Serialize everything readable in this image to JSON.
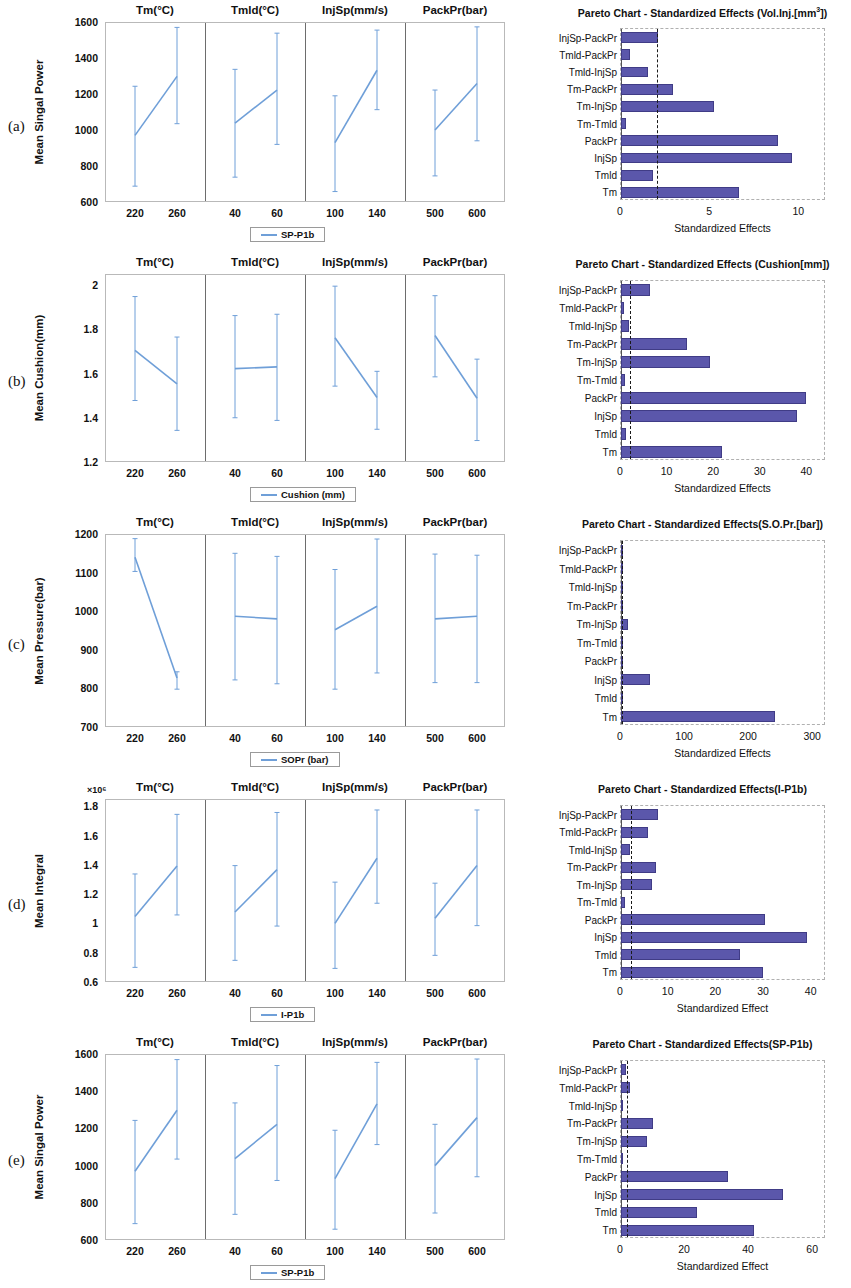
{
  "figure": {
    "panel_letters": [
      "(a)",
      "(b)",
      "(c)",
      "(d)",
      "(e)"
    ],
    "factor_titles": [
      "Tm(°C)",
      "Tmld(°C)",
      "InjSp(mm/s)",
      "PackPr(bar)"
    ],
    "factor_levels": [
      [
        "220",
        "260"
      ],
      [
        "40",
        "60"
      ],
      [
        "100",
        "140"
      ],
      [
        "500",
        "600"
      ]
    ],
    "colors": {
      "line": "#6f9fd8",
      "bar": "#5b57ab",
      "bar_edge": "#403c86",
      "threshold": "#1a1a1a"
    }
  },
  "panels": [
    {
      "letter": "(a)",
      "main_effects": {
        "ylabel": "Mean Singal Power",
        "yticks": [
          "1600",
          "1400",
          "1200",
          "1000",
          "800",
          "600"
        ],
        "legend": "SP-P1b",
        "exponent": ""
      },
      "pareto": {
        "title": "Pareto Chart - Standardized Effects (Vol.Inj.[mm³])",
        "xlabel": "Standardized Effects",
        "xticks": [
          "0",
          "5",
          "10"
        ]
      }
    },
    {
      "letter": "(b)",
      "main_effects": {
        "ylabel": "Mean Cushion(mm)",
        "yticks": [
          "2",
          "1.8",
          "1.6",
          "1.4",
          "1.2"
        ],
        "legend": "Cushion (mm)",
        "exponent": ""
      },
      "pareto": {
        "title": "Pareto Chart - Standardized Effects (Cushion[mm])",
        "xlabel": "Standardized Effects",
        "xticks": [
          "0",
          "10",
          "20",
          "30",
          "40"
        ]
      }
    },
    {
      "letter": "(c)",
      "main_effects": {
        "ylabel": "Mean Pressure(bar)",
        "yticks": [
          "1200",
          "1100",
          "1000",
          "900",
          "800",
          "700"
        ],
        "legend": "SOPr (bar)",
        "exponent": ""
      },
      "pareto": {
        "title": "Pareto Chart - Standardized Effects(S.O.Pr.[bar])",
        "xlabel": "Standardized Effects",
        "xticks": [
          "0",
          "100",
          "200",
          "300"
        ]
      }
    },
    {
      "letter": "(d)",
      "main_effects": {
        "ylabel": "Mean Integral",
        "yticks": [
          "1.8",
          "1.6",
          "1.4",
          "1.2",
          "1",
          "0.8",
          "0.6"
        ],
        "legend": "I-P1b",
        "exponent": "×10⁶"
      },
      "pareto": {
        "title": "Pareto Chart - Standardized Effects(I-P1b)",
        "xlabel": "Standardized Effect",
        "xticks": [
          "0",
          "10",
          "20",
          "30",
          "40"
        ]
      }
    },
    {
      "letter": "(e)",
      "main_effects": {
        "ylabel": "Mean Singal Power",
        "yticks": [
          "1600",
          "1400",
          "1200",
          "1000",
          "800",
          "600"
        ],
        "legend": "SP-P1b",
        "exponent": ""
      },
      "pareto": {
        "title": "Pareto Chart - Standardized Effects(SP-P1b)",
        "xlabel": "Standardized Effect",
        "xticks": [
          "0",
          "20",
          "40",
          "60"
        ]
      }
    }
  ],
  "chart_data": [
    {
      "type": "line",
      "panel": "(a)",
      "title": "Main Effects Plot — Mean Singal Power",
      "ylabel": "Mean Singal Power",
      "ylim": [
        600,
        1600
      ],
      "legend": "SP-P1b",
      "groups": [
        {
          "name": "Tm(°C)",
          "xlabel": "Tm(°C)",
          "categories": [
            "220",
            "260"
          ],
          "values": [
            970,
            1298
          ],
          "err_low": [
            688,
            1035
          ],
          "err_high": [
            1243,
            1570
          ]
        },
        {
          "name": "Tmld(°C)",
          "xlabel": "Tmld(°C)",
          "categories": [
            "40",
            "60"
          ],
          "values": [
            1038,
            1222
          ],
          "err_low": [
            738,
            920
          ],
          "err_high": [
            1337,
            1538
          ]
        },
        {
          "name": "InjSp(mm/s)",
          "xlabel": "InjSp(mm/s)",
          "categories": [
            "100",
            "140"
          ],
          "values": [
            930,
            1332
          ],
          "err_low": [
            658,
            1113
          ],
          "err_high": [
            1190,
            1555
          ]
        },
        {
          "name": "PackPr(bar)",
          "xlabel": "PackPr(bar)",
          "categories": [
            "500",
            "600"
          ],
          "values": [
            1000,
            1258
          ],
          "err_low": [
            745,
            940
          ],
          "err_high": [
            1222,
            1573
          ]
        }
      ]
    },
    {
      "type": "bar",
      "panel": "(a)",
      "orientation": "horizontal",
      "title": "Pareto Chart - Standardized Effects (Vol.Inj.[mm³])",
      "xlabel": "Standardized Effects",
      "xlim": [
        0,
        11.5
      ],
      "xticks": [
        0,
        5,
        10
      ],
      "threshold": 2.0,
      "categories": [
        "InjSp-PackPr",
        "Tmld-PackPr",
        "Tmld-InjSp",
        "Tm-PackPr",
        "Tm-InjSp",
        "Tm-Tmld",
        "PackPr",
        "InjSp",
        "Tmld",
        "Tm"
      ],
      "values": [
        2.1,
        0.5,
        1.5,
        2.9,
        5.2,
        0.3,
        8.8,
        9.6,
        1.8,
        6.6
      ]
    },
    {
      "type": "line",
      "panel": "(b)",
      "title": "Main Effects Plot — Mean Cushion(mm)",
      "ylabel": "Mean Cushion(mm)",
      "ylim": [
        1.2,
        2.05
      ],
      "legend": "Cushion (mm)",
      "groups": [
        {
          "name": "Tm(°C)",
          "xlabel": "Tm(°C)",
          "categories": [
            "220",
            "260"
          ],
          "values": [
            1.705,
            1.553
          ],
          "err_low": [
            1.478,
            1.343
          ],
          "err_high": [
            1.948,
            1.765
          ]
        },
        {
          "name": "Tmld(°C)",
          "xlabel": "Tmld(°C)",
          "categories": [
            "40",
            "60"
          ],
          "values": [
            1.622,
            1.63
          ],
          "err_low": [
            1.4,
            1.388
          ],
          "err_high": [
            1.862,
            1.868
          ]
        },
        {
          "name": "InjSp(mm/s)",
          "xlabel": "InjSp(mm/s)",
          "categories": [
            "100",
            "140"
          ],
          "values": [
            1.762,
            1.492
          ],
          "err_low": [
            1.543,
            1.348
          ],
          "err_high": [
            1.995,
            1.61
          ]
        },
        {
          "name": "PackPr(bar)",
          "xlabel": "PackPr(bar)",
          "categories": [
            "500",
            "600"
          ],
          "values": [
            1.772,
            1.488
          ],
          "err_low": [
            1.585,
            1.297
          ],
          "err_high": [
            1.952,
            1.665
          ]
        }
      ]
    },
    {
      "type": "bar",
      "panel": "(b)",
      "orientation": "horizontal",
      "title": "Pareto Chart - Standardized Effects (Cushion[mm])",
      "xlabel": "Standardized Effects",
      "xlim": [
        0,
        44
      ],
      "xticks": [
        0,
        10,
        20,
        30,
        40
      ],
      "threshold": 2.0,
      "categories": [
        "InjSp-PackPr",
        "Tmld-PackPr",
        "Tmld-InjSp",
        "Tm-PackPr",
        "Tm-InjSp",
        "Tm-Tmld",
        "PackPr",
        "InjSp",
        "Tmld",
        "Tm"
      ],
      "values": [
        6.3,
        0.6,
        1.8,
        14.2,
        19.0,
        0.8,
        39.8,
        37.8,
        1.0,
        21.7
      ]
    },
    {
      "type": "line",
      "panel": "(c)",
      "title": "Main Effects Plot — Mean Pressure(bar)",
      "ylabel": "Mean Pressure(bar)",
      "ylim": [
        700,
        1200
      ],
      "legend": "SOPr (bar)",
      "groups": [
        {
          "name": "Tm(°C)",
          "xlabel": "Tm(°C)",
          "categories": [
            "220",
            "260"
          ],
          "values": [
            1140,
            827
          ],
          "err_low": [
            1103,
            798
          ],
          "err_high": [
            1188,
            843
          ]
        },
        {
          "name": "Tmld(°C)",
          "xlabel": "Tmld(°C)",
          "categories": [
            "40",
            "60"
          ],
          "values": [
            987,
            980
          ],
          "err_low": [
            822,
            812
          ],
          "err_high": [
            1150,
            1142
          ]
        },
        {
          "name": "InjSp(mm/s)",
          "xlabel": "InjSp(mm/s)",
          "categories": [
            "100",
            "140"
          ],
          "values": [
            952,
            1013
          ],
          "err_low": [
            798,
            840
          ],
          "err_high": [
            1108,
            1187
          ]
        },
        {
          "name": "PackPr(bar)",
          "xlabel": "PackPr(bar)",
          "categories": [
            "500",
            "600"
          ],
          "values": [
            980,
            987
          ],
          "err_low": [
            815,
            815
          ],
          "err_high": [
            1148,
            1145
          ]
        }
      ]
    },
    {
      "type": "bar",
      "panel": "(c)",
      "orientation": "horizontal",
      "title": "Pareto Chart - Standardized Effects(S.O.Pr.[bar])",
      "xlabel": "Standardized Effects",
      "xlim": [
        0,
        320
      ],
      "xticks": [
        0,
        100,
        200,
        300
      ],
      "threshold": 2.0,
      "categories": [
        "InjSp-PackPr",
        "Tmld-PackPr",
        "Tmld-InjSp",
        "Tm-PackPr",
        "Tm-InjSp",
        "Tm-Tmld",
        "PackPr",
        "InjSp",
        "Tmld",
        "Tm"
      ],
      "values": [
        1.5,
        0.8,
        0.8,
        3.5,
        11.0,
        0.6,
        3.0,
        45.0,
        3.5,
        240.0
      ]
    },
    {
      "type": "line",
      "panel": "(d)",
      "title": "Main Effects Plot — Mean Integral",
      "ylabel": "Mean Integral",
      "y_exponent": "×10⁶",
      "ylim": [
        0.6,
        1.85
      ],
      "legend": "I-P1b",
      "groups": [
        {
          "name": "Tm(°C)",
          "xlabel": "Tm(°C)",
          "categories": [
            "220",
            "260"
          ],
          "values": [
            1.048,
            1.392
          ],
          "err_low": [
            0.7,
            1.058
          ],
          "err_high": [
            1.338,
            1.745
          ]
        },
        {
          "name": "Tmld(°C)",
          "xlabel": "Tmld(°C)",
          "categories": [
            "40",
            "60"
          ],
          "values": [
            1.078,
            1.368
          ],
          "err_low": [
            0.748,
            0.982
          ],
          "err_high": [
            1.395,
            1.758
          ]
        },
        {
          "name": "InjSp(mm/s)",
          "xlabel": "InjSp(mm/s)",
          "categories": [
            "100",
            "140"
          ],
          "values": [
            1.0,
            1.445
          ],
          "err_low": [
            0.693,
            1.138
          ],
          "err_high": [
            1.282,
            1.775
          ]
        },
        {
          "name": "PackPr(bar)",
          "xlabel": "PackPr(bar)",
          "categories": [
            "500",
            "600"
          ],
          "values": [
            1.035,
            1.395
          ],
          "err_low": [
            0.782,
            0.985
          ],
          "err_high": [
            1.275,
            1.775
          ]
        }
      ]
    },
    {
      "type": "bar",
      "panel": "(d)",
      "orientation": "horizontal",
      "title": "Pareto Chart - Standardized Effects(I-P1b)",
      "xlabel": "Standardized Effect",
      "xlim": [
        0,
        43
      ],
      "xticks": [
        0,
        10,
        20,
        30,
        40
      ],
      "threshold": 2.0,
      "categories": [
        "InjSp-PackPr",
        "Tmld-PackPr",
        "Tmld-InjSp",
        "Tm-PackPr",
        "Tm-InjSp",
        "Tm-Tmld",
        "PackPr",
        "InjSp",
        "Tmld",
        "Tm"
      ],
      "values": [
        7.8,
        5.7,
        1.8,
        7.4,
        6.4,
        0.9,
        30.3,
        39.0,
        25.0,
        29.7
      ]
    },
    {
      "type": "line",
      "panel": "(e)",
      "title": "Main Effects Plot — Mean Singal Power",
      "ylabel": "Mean Singal Power",
      "ylim": [
        600,
        1600
      ],
      "legend": "SP-P1b",
      "groups": [
        {
          "name": "Tm(°C)",
          "xlabel": "Tm(°C)",
          "categories": [
            "220",
            "260"
          ],
          "values": [
            970,
            1298
          ],
          "err_low": [
            688,
            1035
          ],
          "err_high": [
            1243,
            1570
          ]
        },
        {
          "name": "Tmld(°C)",
          "xlabel": "Tmld(°C)",
          "categories": [
            "40",
            "60"
          ],
          "values": [
            1038,
            1222
          ],
          "err_low": [
            738,
            920
          ],
          "err_high": [
            1337,
            1538
          ]
        },
        {
          "name": "InjSp(mm/s)",
          "xlabel": "InjSp(mm/s)",
          "categories": [
            "100",
            "140"
          ],
          "values": [
            930,
            1332
          ],
          "err_low": [
            658,
            1113
          ],
          "err_high": [
            1190,
            1555
          ]
        },
        {
          "name": "PackPr(bar)",
          "xlabel": "PackPr(bar)",
          "categories": [
            "500",
            "600"
          ],
          "values": [
            1000,
            1258
          ],
          "err_low": [
            745,
            940
          ],
          "err_high": [
            1222,
            1573
          ]
        }
      ]
    },
    {
      "type": "bar",
      "panel": "(e)",
      "orientation": "horizontal",
      "title": "Pareto Chart - Standardized Effects(SP-P1b)",
      "xlabel": "Standardized Effect",
      "xlim": [
        0,
        64
      ],
      "xticks": [
        0,
        20,
        40,
        60
      ],
      "threshold": 2.0,
      "categories": [
        "InjSp-PackPr",
        "Tmld-PackPr",
        "Tmld-InjSp",
        "Tm-PackPr",
        "Tm-InjSp",
        "Tm-Tmld",
        "PackPr",
        "InjSp",
        "Tmld",
        "Tm"
      ],
      "values": [
        1.6,
        2.7,
        0.5,
        10.0,
        8.0,
        0.4,
        33.5,
        50.5,
        23.8,
        41.5
      ]
    }
  ]
}
